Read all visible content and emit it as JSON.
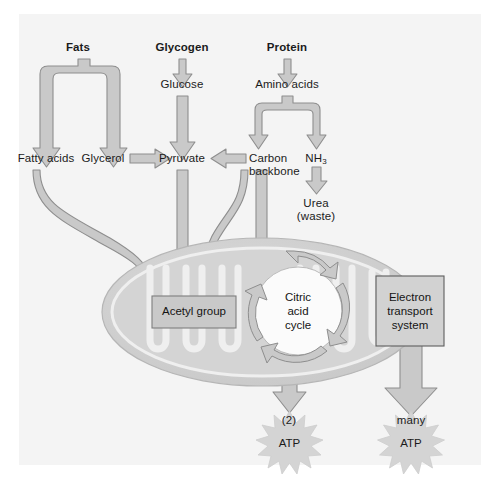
{
  "figure": {
    "background_color": "#f4f4f4",
    "arrow_fill": "#c9c9c9",
    "arrow_stroke": "#8e8e8e",
    "mito_outer": "#cfcfcf",
    "mito_matrix": "#d7d7d7",
    "text_color": "#1b1b1b"
  },
  "sources": {
    "fats": "Fats",
    "glycogen": "Glycogen",
    "protein": "Protein"
  },
  "intermediates": {
    "glucose": "Glucose",
    "amino_acids": "Amino acids",
    "fatty_acids": "Fatty acids",
    "glycerol": "Glycerol",
    "pyruvate": "Pyruvate",
    "carbon_backbone_line1": "Carbon",
    "carbon_backbone_line2": "backbone",
    "ammonia": "NH",
    "ammonia_sub": "3",
    "urea_line1": "Urea",
    "urea_line2": "(waste)"
  },
  "mitochondrion": {
    "acetyl_group": "Acetyl group",
    "citric_cycle_line1": "Citric",
    "citric_cycle_line2": "acid",
    "citric_cycle_line3": "cycle",
    "ets_line1": "Electron",
    "ets_line2": "transport",
    "ets_line3": "system"
  },
  "outputs": {
    "atp_left_yield": "(2)",
    "atp_left_label": "ATP",
    "atp_right_yield": "many",
    "atp_right_label": "ATP"
  }
}
